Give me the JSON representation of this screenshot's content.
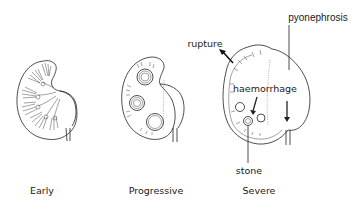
{
  "figure": {
    "stages": [
      {
        "id": "early",
        "label": "Early"
      },
      {
        "id": "progressive",
        "label": "Progressive"
      },
      {
        "id": "severe",
        "label": "Severe"
      }
    ],
    "annotations": {
      "rupture": "rupture",
      "pyonephrosis": "pyonephrosis",
      "haemorrhage": "haemorrhage",
      "stone": "stone"
    }
  }
}
